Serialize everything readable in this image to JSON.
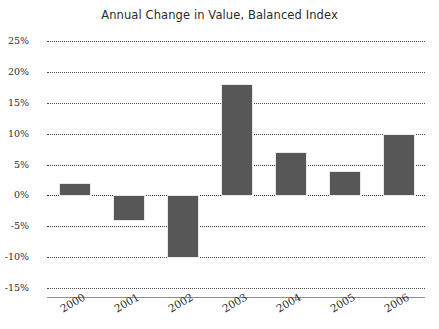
{
  "chart_data": {
    "type": "bar",
    "title": "Annual Change in Value, Balanced Index",
    "xlabel": "",
    "ylabel": "",
    "categories": [
      "2000",
      "2001",
      "2002",
      "2003",
      "2004",
      "2005",
      "2006"
    ],
    "values": [
      2,
      -4,
      -10,
      18,
      7,
      4,
      10
    ],
    "ylim": [
      -15,
      25
    ],
    "ytick_labels": [
      "25%",
      "20%",
      "15%",
      "10%",
      "5%",
      "0%",
      "-5%",
      "-10%",
      "-15%"
    ],
    "ytick_values": [
      25,
      20,
      15,
      10,
      5,
      0,
      -5,
      -10,
      -15
    ],
    "grid": true,
    "grid_style": "dotted-horizontal",
    "legend": null,
    "bar_color": "#575757",
    "axis_color": "#8d8d8d",
    "grid_color": "#4a4a4a",
    "value_suffix": "%",
    "xtick_rotation": -30
  }
}
